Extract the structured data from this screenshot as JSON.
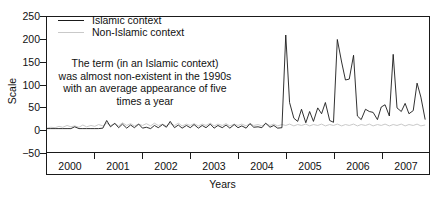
{
  "chart_data": {
    "type": "line",
    "title": "",
    "xlabel": "Years",
    "ylabel": "Scale",
    "ylim": [
      -50,
      250
    ],
    "yticks": [
      250,
      200,
      150,
      100,
      50,
      0,
      -50
    ],
    "ytick_labels": [
      "250",
      "200",
      "150",
      "100",
      "50",
      "0",
      "−50"
    ],
    "xlim": [
      2000,
      2008
    ],
    "xtick_labels": [
      "2000",
      "2001",
      "2002",
      "2003",
      "2004",
      "2005",
      "2006",
      "2007"
    ],
    "grid": false,
    "legend_position": "top-left",
    "annotation": {
      "lines": [
        "The term (in an Islamic context)",
        "was almost non-existent in the 1990s",
        "with an average appearance of five",
        "times a year"
      ]
    },
    "series": [
      {
        "name": "Islamic context",
        "color": "#1a1a1a",
        "x": [
          2000.0,
          2000.08,
          2000.17,
          2000.25,
          2000.33,
          2000.42,
          2000.5,
          2000.58,
          2000.67,
          2000.75,
          2000.83,
          2000.92,
          2001.0,
          2001.08,
          2001.17,
          2001.25,
          2001.33,
          2001.42,
          2001.5,
          2001.58,
          2001.67,
          2001.75,
          2001.83,
          2001.92,
          2002.0,
          2002.08,
          2002.17,
          2002.25,
          2002.33,
          2002.42,
          2002.5,
          2002.58,
          2002.67,
          2002.75,
          2002.83,
          2002.92,
          2003.0,
          2003.08,
          2003.17,
          2003.25,
          2003.33,
          2003.42,
          2003.5,
          2003.58,
          2003.67,
          2003.75,
          2003.83,
          2003.92,
          2004.0,
          2004.08,
          2004.17,
          2004.25,
          2004.33,
          2004.42,
          2004.5,
          2004.58,
          2004.67,
          2004.75,
          2004.83,
          2004.92,
          2005.0,
          2005.08,
          2005.17,
          2005.25,
          2005.33,
          2005.42,
          2005.5,
          2005.58,
          2005.67,
          2005.75,
          2005.83,
          2005.92,
          2006.0,
          2006.08,
          2006.17,
          2006.25,
          2006.33,
          2006.42,
          2006.5,
          2006.58,
          2006.67,
          2006.75,
          2006.83,
          2006.92,
          2007.0,
          2007.08,
          2007.17,
          2007.25,
          2007.33,
          2007.42,
          2007.5,
          2007.58,
          2007.67,
          2007.75,
          2007.83,
          2007.92
        ],
        "values": [
          2,
          2,
          2,
          2,
          2,
          2,
          2,
          6,
          2,
          2,
          2,
          2,
          2,
          2,
          3,
          20,
          6,
          14,
          4,
          12,
          3,
          10,
          4,
          12,
          3,
          5,
          2,
          9,
          4,
          11,
          5,
          18,
          4,
          10,
          3,
          9,
          4,
          11,
          3,
          9,
          4,
          12,
          3,
          9,
          4,
          10,
          3,
          11,
          4,
          8,
          3,
          13,
          5,
          6,
          4,
          14,
          5,
          9,
          3,
          4,
          210,
          60,
          25,
          18,
          45,
          15,
          40,
          18,
          48,
          35,
          60,
          20,
          16,
          200,
          150,
          110,
          112,
          165,
          30,
          22,
          45,
          40,
          38,
          22,
          50,
          55,
          30,
          167,
          48,
          40,
          58,
          35,
          42,
          103,
          72,
          22
        ]
      },
      {
        "name": "Non-Islamic context",
        "color": "#c9c9c9",
        "x": [
          2000.0,
          2000.08,
          2000.17,
          2000.25,
          2000.33,
          2000.42,
          2000.5,
          2000.58,
          2000.67,
          2000.75,
          2000.83,
          2000.92,
          2001.0,
          2001.08,
          2001.17,
          2001.25,
          2001.33,
          2001.42,
          2001.5,
          2001.58,
          2001.67,
          2001.75,
          2001.83,
          2001.92,
          2002.0,
          2002.08,
          2002.17,
          2002.25,
          2002.33,
          2002.42,
          2002.5,
          2002.58,
          2002.67,
          2002.75,
          2002.83,
          2002.92,
          2003.0,
          2003.08,
          2003.17,
          2003.25,
          2003.33,
          2003.42,
          2003.5,
          2003.58,
          2003.67,
          2003.75,
          2003.83,
          2003.92,
          2004.0,
          2004.08,
          2004.17,
          2004.25,
          2004.33,
          2004.42,
          2004.5,
          2004.58,
          2004.67,
          2004.75,
          2004.83,
          2004.92,
          2005.0,
          2005.08,
          2005.17,
          2005.25,
          2005.33,
          2005.42,
          2005.5,
          2005.58,
          2005.67,
          2005.75,
          2005.83,
          2005.92,
          2006.0,
          2006.08,
          2006.17,
          2006.25,
          2006.33,
          2006.42,
          2006.5,
          2006.58,
          2006.67,
          2006.75,
          2006.83,
          2006.92,
          2007.0,
          2007.08,
          2007.17,
          2007.25,
          2007.33,
          2007.42,
          2007.5,
          2007.58,
          2007.67,
          2007.75,
          2007.83,
          2007.92
        ],
        "values": [
          3,
          5,
          4,
          7,
          5,
          9,
          6,
          8,
          5,
          10,
          6,
          9,
          7,
          11,
          8,
          14,
          9,
          12,
          8,
          15,
          9,
          13,
          8,
          12,
          9,
          13,
          8,
          14,
          9,
          12,
          8,
          13,
          9,
          14,
          8,
          12,
          9,
          13,
          8,
          12,
          9,
          14,
          8,
          12,
          9,
          13,
          8,
          12,
          9,
          12,
          8,
          13,
          9,
          11,
          8,
          13,
          9,
          12,
          8,
          11,
          9,
          12,
          8,
          11,
          9,
          12,
          8,
          11,
          9,
          12,
          8,
          11,
          9,
          12,
          8,
          11,
          9,
          12,
          8,
          11,
          9,
          12,
          8,
          11,
          9,
          12,
          8,
          11,
          9,
          12,
          8,
          11,
          9,
          12,
          8,
          10
        ]
      }
    ]
  },
  "legend": {
    "items": [
      {
        "label": "Islamic context"
      },
      {
        "label": "Non-Islamic context"
      }
    ]
  },
  "axes": {
    "ylabel": "Scale",
    "xlabel": "Years"
  }
}
